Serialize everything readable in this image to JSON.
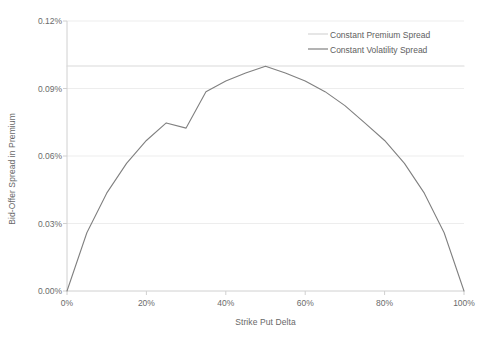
{
  "chart_data": {
    "type": "line",
    "title": "",
    "xlabel": "Strike Put Delta",
    "ylabel": "Bid-Offer Spread in Premium",
    "xlim": [
      0,
      100
    ],
    "ylim": [
      0,
      0.12
    ],
    "xtick_labels": [
      "0%",
      "20%",
      "40%",
      "60%",
      "80%",
      "100%"
    ],
    "xtick_values": [
      0,
      20,
      40,
      60,
      80,
      100
    ],
    "ytick_labels": [
      "0.00%",
      "0.03%",
      "0.06%",
      "0.09%",
      "0.12%"
    ],
    "ytick_values": [
      0,
      0.03,
      0.06,
      0.09,
      0.12
    ],
    "grid": "horizontal",
    "legend_position": "top-right-inside",
    "series": [
      {
        "name": "Constant Premium Spread",
        "color": "#d9d9d9",
        "style": "flat-line",
        "x": [
          0,
          10,
          20,
          30,
          40,
          50,
          60,
          70,
          80,
          90,
          100
        ],
        "values": [
          0.1,
          0.1,
          0.1,
          0.1,
          0.1,
          0.1,
          0.1,
          0.1,
          0.1,
          0.1,
          0.1
        ]
      },
      {
        "name": "Constant Volatility Spread",
        "color": "#808080",
        "style": "parabola",
        "x": [
          0,
          5,
          10,
          15,
          20,
          25,
          30,
          35,
          40,
          45,
          50,
          55,
          60,
          65,
          70,
          75,
          80,
          85,
          90,
          95,
          100
        ],
        "values": [
          0.0,
          0.0259,
          0.0435,
          0.0567,
          0.0669,
          0.0747,
          0.0724,
          0.0886,
          0.0933,
          0.0969,
          0.0999,
          0.0969,
          0.0933,
          0.0886,
          0.0824,
          0.0747,
          0.0669,
          0.0567,
          0.0435,
          0.0259,
          0.0
        ]
      }
    ]
  },
  "axes": {
    "plot_left": 67,
    "plot_right": 464,
    "plot_top": 21,
    "plot_bottom": 291,
    "axis_color": "#d0d0d0",
    "grid_color": "#ededed",
    "background": "#ffffff"
  },
  "legend": {
    "items": [
      {
        "label": "Constant Premium Spread",
        "color": "#d9d9d9"
      },
      {
        "label": "Constant Volatility Spread",
        "color": "#808080"
      }
    ]
  }
}
